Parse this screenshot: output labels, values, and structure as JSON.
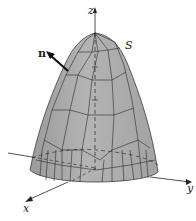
{
  "figure": {
    "labels": {
      "z_axis": "z",
      "y_axis": "y",
      "x_axis": "x",
      "surface": "S",
      "normal": "n"
    },
    "colors": {
      "surface_fill": "#a9a9a9",
      "surface_dark": "#8f8f8f",
      "edges": "#2a2a2a",
      "axes": "#222222",
      "background": "#ffffff"
    }
  }
}
